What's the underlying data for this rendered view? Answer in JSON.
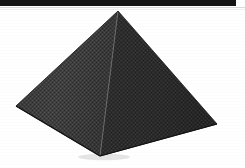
{
  "canvas": {
    "width": 245,
    "height": 168,
    "background_color": "#ffffff"
  },
  "top_band": {
    "name": "top-dark-band",
    "color": "#141414",
    "x": 0,
    "y": 0,
    "width": 236,
    "height": 6
  },
  "rules": [
    {
      "name": "scan-rule-upper",
      "color": "#d9d9d9",
      "y": 7
    },
    {
      "name": "scan-rule-lower",
      "color": "#efefef",
      "y": 9
    }
  ],
  "figure": {
    "label": "pyramid",
    "type": "square-pyramid",
    "shading": "dithered-halftone",
    "apex": {
      "x": 118,
      "y": 11
    },
    "left_corner": {
      "x": 16,
      "y": 106
    },
    "right_corner": {
      "x": 217,
      "y": 124
    },
    "front_corner": {
      "x": 100,
      "y": 156
    },
    "left_face_color": "#3b3b3b",
    "right_face_color": "#2e2e2e",
    "edge_color": "#6a6a6a",
    "outline_color": "#1c1c1c"
  }
}
